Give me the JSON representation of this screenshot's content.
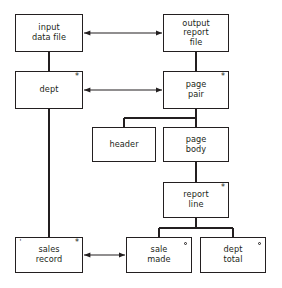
{
  "diagram": {
    "type": "jackson-structure-diagram",
    "line_color": "#231f20",
    "background_color": "#ffffff",
    "nodes": [
      {
        "id": "input-data-file",
        "label": "input\ndata file",
        "x": 15,
        "y": 14,
        "w": 68,
        "h": 38,
        "marker": "none"
      },
      {
        "id": "output-report-file",
        "label": "output\nreport\nfile",
        "x": 163,
        "y": 14,
        "w": 66,
        "h": 38,
        "marker": "none"
      },
      {
        "id": "dept",
        "label": "dept",
        "x": 15,
        "y": 71,
        "w": 68,
        "h": 38,
        "marker": "star"
      },
      {
        "id": "page-pair",
        "label": "page\npair",
        "x": 163,
        "y": 71,
        "w": 66,
        "h": 38,
        "marker": "star"
      },
      {
        "id": "header",
        "label": "header",
        "x": 92,
        "y": 127,
        "w": 64,
        "h": 35,
        "marker": "none"
      },
      {
        "id": "page-body",
        "label": "page\nbody",
        "x": 163,
        "y": 127,
        "w": 66,
        "h": 35,
        "marker": "none"
      },
      {
        "id": "report-line",
        "label": "report\nline",
        "x": 163,
        "y": 182,
        "w": 66,
        "h": 36,
        "marker": "star"
      },
      {
        "id": "sales-record",
        "label": "sales\nrecord",
        "x": 15,
        "y": 237,
        "w": 68,
        "h": 36,
        "marker": "star-tick"
      },
      {
        "id": "sale-made",
        "label": "sale\nmade",
        "x": 126,
        "y": 237,
        "w": 66,
        "h": 36,
        "marker": "circle"
      },
      {
        "id": "dept-total",
        "label": "dept\ntotal",
        "x": 200,
        "y": 237,
        "w": 66,
        "h": 36,
        "marker": "circle"
      }
    ],
    "connections": [
      {
        "id": "input-to-output",
        "kind": "double-arrow",
        "from": "input-data-file",
        "to": "output-report-file"
      },
      {
        "id": "dept-to-pagepair",
        "kind": "double-arrow",
        "from": "dept",
        "to": "page-pair"
      },
      {
        "id": "salesrecord-to-salemade",
        "kind": "double-arrow",
        "from": "sales-record",
        "to": "sale-made"
      },
      {
        "id": "input-to-dept",
        "kind": "line",
        "from": "input-data-file",
        "to": "dept"
      },
      {
        "id": "output-to-pagepair",
        "kind": "line",
        "from": "output-report-file",
        "to": "page-pair"
      },
      {
        "id": "pagepair-to-children",
        "kind": "tree",
        "from": "page-pair",
        "to": "header, page-body"
      },
      {
        "id": "pagebody-to-reportline",
        "kind": "line",
        "from": "page-body",
        "to": "report-line"
      },
      {
        "id": "reportline-to-children",
        "kind": "tree",
        "from": "report-line",
        "to": "sale-made, dept-total"
      },
      {
        "id": "dept-to-salesrecord",
        "kind": "line",
        "from": "dept",
        "to": "sales-record"
      }
    ],
    "markers": {
      "star_symbol": "*",
      "circle_symbol": "o",
      "tick_symbol": "'",
      "star_meaning": "iteration",
      "circle_meaning": "selection"
    }
  }
}
